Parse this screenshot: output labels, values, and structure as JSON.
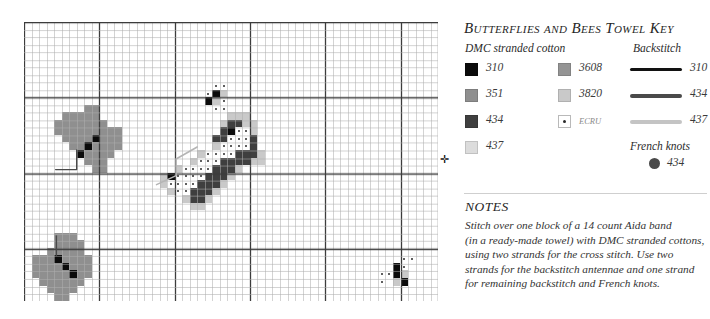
{
  "key": {
    "title": "Butterflies and Bees Towel Key",
    "subhead_dmc": "DMC stranded cotton",
    "subhead_backstitch": "Backstitch",
    "subhead_french_knots": "French knots",
    "floss_left": [
      {
        "code": "310",
        "color": "#0b0b0b",
        "swatch": "solid"
      },
      {
        "code": "351",
        "color": "#8f8f8f",
        "swatch": "solid"
      },
      {
        "code": "434",
        "color": "#3f3f3f",
        "swatch": "solid"
      },
      {
        "code": "437",
        "color": "#dcdcdc",
        "swatch": "solid"
      }
    ],
    "floss_right": [
      {
        "code": "3608",
        "color": "#949494",
        "swatch": "solid"
      },
      {
        "code": "3820",
        "color": "#c9c9c9",
        "swatch": "solid"
      },
      {
        "code": "ECRU",
        "color": "#ffffff",
        "swatch": "dotted"
      }
    ],
    "backstitch": [
      {
        "code": "310",
        "color": "#121212",
        "weight": 3
      },
      {
        "code": "434",
        "color": "#4a4a4a",
        "weight": 4
      },
      {
        "code": "437",
        "color": "#c4c4c4",
        "weight": 4
      }
    ],
    "french_knots": [
      {
        "code": "434",
        "color": "#4a4a4a"
      }
    ]
  },
  "notes": {
    "heading": "NOTES",
    "lines": [
      "Stitch over one block of a 14 count Aida band",
      "(in a ready-made towel) with DMC stranded cottons,",
      "using two strands for the cross stitch. Use two",
      "strands for the backstitch antennae and one strand",
      "for remaining backstitch and French knots."
    ]
  },
  "chart_data": {
    "type": "heatmap",
    "title": "Butterflies and Bees Towel Key",
    "xlabel": "",
    "ylabel": "",
    "grid": true,
    "legend_position": "right",
    "columns": 55,
    "rows": 37,
    "cell_px": 7.53,
    "heavy_line_every": 10,
    "grid_line_color": "#aeaeae",
    "heavy_line_color": "#3c3c3c",
    "center_markers": [
      {
        "edge": "right",
        "row": 18
      },
      {
        "edge": "left",
        "row": 18
      }
    ],
    "palette": {
      "310": "#0b0b0b",
      "351": "#8f8f8f",
      "434": "#3f3f3f",
      "437": "#dcdcdc",
      "3608": "#949494",
      "3820": "#c9c9c9",
      "ECRU": "#ffffff"
    },
    "cells": [
      {
        "c": 5,
        "r": 12,
        "v": "351"
      },
      {
        "c": 6,
        "r": 12,
        "v": "351"
      },
      {
        "c": 7,
        "r": 12,
        "v": "351"
      },
      {
        "c": 8,
        "r": 11,
        "v": "351"
      },
      {
        "c": 9,
        "r": 11,
        "v": "351"
      },
      {
        "c": 8,
        "r": 12,
        "v": "351"
      },
      {
        "c": 9,
        "r": 12,
        "v": "351"
      },
      {
        "c": 4,
        "r": 13,
        "v": "351"
      },
      {
        "c": 5,
        "r": 13,
        "v": "351"
      },
      {
        "c": 6,
        "r": 13,
        "v": "351"
      },
      {
        "c": 7,
        "r": 13,
        "v": "351"
      },
      {
        "c": 8,
        "r": 13,
        "v": "351"
      },
      {
        "c": 9,
        "r": 13,
        "v": "351"
      },
      {
        "c": 10,
        "r": 13,
        "v": "351"
      },
      {
        "c": 4,
        "r": 14,
        "v": "351"
      },
      {
        "c": 5,
        "r": 14,
        "v": "351"
      },
      {
        "c": 6,
        "r": 14,
        "v": "351"
      },
      {
        "c": 7,
        "r": 14,
        "v": "351"
      },
      {
        "c": 8,
        "r": 14,
        "v": "351"
      },
      {
        "c": 9,
        "r": 14,
        "v": "351"
      },
      {
        "c": 10,
        "r": 14,
        "v": "351"
      },
      {
        "c": 11,
        "r": 14,
        "v": "351"
      },
      {
        "c": 12,
        "r": 14,
        "v": "351"
      },
      {
        "c": 5,
        "r": 15,
        "v": "351"
      },
      {
        "c": 6,
        "r": 15,
        "v": "351"
      },
      {
        "c": 7,
        "r": 15,
        "v": "351"
      },
      {
        "c": 8,
        "r": 15,
        "v": "351"
      },
      {
        "c": 9,
        "r": 15,
        "v": "310"
      },
      {
        "c": 10,
        "r": 15,
        "v": "351"
      },
      {
        "c": 11,
        "r": 15,
        "v": "351"
      },
      {
        "c": 12,
        "r": 15,
        "v": "351"
      },
      {
        "c": 6,
        "r": 16,
        "v": "351"
      },
      {
        "c": 7,
        "r": 16,
        "v": "351"
      },
      {
        "c": 8,
        "r": 16,
        "v": "310"
      },
      {
        "c": 9,
        "r": 16,
        "v": "351"
      },
      {
        "c": 10,
        "r": 16,
        "v": "351"
      },
      {
        "c": 11,
        "r": 16,
        "v": "351"
      },
      {
        "c": 12,
        "r": 16,
        "v": "351"
      },
      {
        "c": 7,
        "r": 17,
        "v": "310"
      },
      {
        "c": 8,
        "r": 17,
        "v": "351"
      },
      {
        "c": 9,
        "r": 17,
        "v": "351"
      },
      {
        "c": 10,
        "r": 17,
        "v": "351"
      },
      {
        "c": 11,
        "r": 17,
        "v": "351"
      },
      {
        "c": 8,
        "r": 18,
        "v": "351"
      },
      {
        "c": 9,
        "r": 18,
        "v": "351"
      },
      {
        "c": 10,
        "r": 18,
        "v": "351"
      },
      {
        "c": 9,
        "r": 19,
        "v": "351"
      },
      {
        "c": 10,
        "r": 19,
        "v": "351"
      },
      {
        "c": 4,
        "r": 28,
        "v": "351"
      },
      {
        "c": 5,
        "r": 28,
        "v": "351"
      },
      {
        "c": 6,
        "r": 28,
        "v": "351"
      },
      {
        "c": 4,
        "r": 29,
        "v": "351"
      },
      {
        "c": 5,
        "r": 29,
        "v": "351"
      },
      {
        "c": 6,
        "r": 29,
        "v": "351"
      },
      {
        "c": 7,
        "r": 29,
        "v": "351"
      },
      {
        "c": 3,
        "r": 30,
        "v": "351"
      },
      {
        "c": 4,
        "r": 30,
        "v": "351"
      },
      {
        "c": 5,
        "r": 30,
        "v": "351"
      },
      {
        "c": 6,
        "r": 30,
        "v": "351"
      },
      {
        "c": 7,
        "r": 30,
        "v": "351"
      },
      {
        "c": 1,
        "r": 31,
        "v": "351"
      },
      {
        "c": 2,
        "r": 31,
        "v": "351"
      },
      {
        "c": 3,
        "r": 31,
        "v": "351"
      },
      {
        "c": 4,
        "r": 31,
        "v": "310"
      },
      {
        "c": 5,
        "r": 31,
        "v": "351"
      },
      {
        "c": 6,
        "r": 31,
        "v": "351"
      },
      {
        "c": 7,
        "r": 31,
        "v": "351"
      },
      {
        "c": 8,
        "r": 31,
        "v": "351"
      },
      {
        "c": 1,
        "r": 32,
        "v": "351"
      },
      {
        "c": 2,
        "r": 32,
        "v": "351"
      },
      {
        "c": 3,
        "r": 32,
        "v": "351"
      },
      {
        "c": 4,
        "r": 32,
        "v": "351"
      },
      {
        "c": 5,
        "r": 32,
        "v": "310"
      },
      {
        "c": 6,
        "r": 32,
        "v": "351"
      },
      {
        "c": 7,
        "r": 32,
        "v": "351"
      },
      {
        "c": 8,
        "r": 32,
        "v": "351"
      },
      {
        "c": 1,
        "r": 33,
        "v": "351"
      },
      {
        "c": 2,
        "r": 33,
        "v": "351"
      },
      {
        "c": 3,
        "r": 33,
        "v": "351"
      },
      {
        "c": 4,
        "r": 33,
        "v": "351"
      },
      {
        "c": 5,
        "r": 33,
        "v": "351"
      },
      {
        "c": 6,
        "r": 33,
        "v": "310"
      },
      {
        "c": 7,
        "r": 33,
        "v": "351"
      },
      {
        "c": 8,
        "r": 33,
        "v": "351"
      },
      {
        "c": 2,
        "r": 34,
        "v": "351"
      },
      {
        "c": 3,
        "r": 34,
        "v": "351"
      },
      {
        "c": 4,
        "r": 34,
        "v": "351"
      },
      {
        "c": 5,
        "r": 34,
        "v": "351"
      },
      {
        "c": 6,
        "r": 34,
        "v": "351"
      },
      {
        "c": 7,
        "r": 34,
        "v": "351"
      },
      {
        "c": 3,
        "r": 35,
        "v": "351"
      },
      {
        "c": 4,
        "r": 35,
        "v": "351"
      },
      {
        "c": 5,
        "r": 35,
        "v": "351"
      },
      {
        "c": 6,
        "r": 35,
        "v": "351"
      },
      {
        "c": 4,
        "r": 36,
        "v": "351"
      },
      {
        "c": 5,
        "r": 36,
        "v": "351"
      },
      {
        "c": 25,
        "r": 8,
        "v": "ECRU"
      },
      {
        "c": 26,
        "r": 8,
        "v": "ECRU"
      },
      {
        "c": 24,
        "r": 9,
        "v": "ECRU"
      },
      {
        "c": 25,
        "r": 9,
        "v": "310"
      },
      {
        "c": 26,
        "r": 9,
        "v": "3820"
      },
      {
        "c": 24,
        "r": 10,
        "v": "310"
      },
      {
        "c": 25,
        "r": 10,
        "v": "3820"
      },
      {
        "c": 26,
        "r": 10,
        "v": "ECRU"
      },
      {
        "c": 25,
        "r": 11,
        "v": "ECRU"
      },
      {
        "c": 26,
        "r": 11,
        "v": "ECRU"
      },
      {
        "c": 27,
        "r": 12,
        "v": "3820"
      },
      {
        "c": 28,
        "r": 12,
        "v": "3820"
      },
      {
        "c": 29,
        "r": 12,
        "v": "3820"
      },
      {
        "c": 26,
        "r": 13,
        "v": "3820"
      },
      {
        "c": 27,
        "r": 13,
        "v": "434"
      },
      {
        "c": 28,
        "r": 13,
        "v": "434"
      },
      {
        "c": 29,
        "r": 13,
        "v": "3820"
      },
      {
        "c": 30,
        "r": 13,
        "v": "3820"
      },
      {
        "c": 26,
        "r": 14,
        "v": "434"
      },
      {
        "c": 27,
        "r": 14,
        "v": "310"
      },
      {
        "c": 28,
        "r": 14,
        "v": "ECRU"
      },
      {
        "c": 29,
        "r": 14,
        "v": "ECRU"
      },
      {
        "c": 30,
        "r": 14,
        "v": "3820"
      },
      {
        "c": 25,
        "r": 15,
        "v": "434"
      },
      {
        "c": 26,
        "r": 15,
        "v": "434"
      },
      {
        "c": 27,
        "r": 15,
        "v": "ECRU"
      },
      {
        "c": 28,
        "r": 15,
        "v": "ECRU"
      },
      {
        "c": 29,
        "r": 15,
        "v": "ECRU"
      },
      {
        "c": 30,
        "r": 15,
        "v": "434"
      },
      {
        "c": 25,
        "r": 16,
        "v": "3820"
      },
      {
        "c": 26,
        "r": 16,
        "v": "ECRU"
      },
      {
        "c": 27,
        "r": 16,
        "v": "ECRU"
      },
      {
        "c": 28,
        "r": 16,
        "v": "ECRU"
      },
      {
        "c": 29,
        "r": 16,
        "v": "ECRU"
      },
      {
        "c": 30,
        "r": 16,
        "v": "434"
      },
      {
        "c": 23,
        "r": 17,
        "v": "3820"
      },
      {
        "c": 24,
        "r": 17,
        "v": "ECRU"
      },
      {
        "c": 25,
        "r": 17,
        "v": "ECRU"
      },
      {
        "c": 26,
        "r": 17,
        "v": "ECRU"
      },
      {
        "c": 27,
        "r": 17,
        "v": "ECRU"
      },
      {
        "c": 28,
        "r": 17,
        "v": "434"
      },
      {
        "c": 29,
        "r": 17,
        "v": "434"
      },
      {
        "c": 30,
        "r": 17,
        "v": "434"
      },
      {
        "c": 31,
        "r": 17,
        "v": "3820"
      },
      {
        "c": 22,
        "r": 18,
        "v": "3820"
      },
      {
        "c": 23,
        "r": 18,
        "v": "ECRU"
      },
      {
        "c": 24,
        "r": 18,
        "v": "ECRU"
      },
      {
        "c": 25,
        "r": 18,
        "v": "ECRU"
      },
      {
        "c": 26,
        "r": 18,
        "v": "434"
      },
      {
        "c": 27,
        "r": 18,
        "v": "434"
      },
      {
        "c": 28,
        "r": 18,
        "v": "434"
      },
      {
        "c": 29,
        "r": 18,
        "v": "434"
      },
      {
        "c": 30,
        "r": 18,
        "v": "3820"
      },
      {
        "c": 31,
        "r": 18,
        "v": "3820"
      },
      {
        "c": 20,
        "r": 19,
        "v": "3820"
      },
      {
        "c": 21,
        "r": 19,
        "v": "ECRU"
      },
      {
        "c": 22,
        "r": 19,
        "v": "ECRU"
      },
      {
        "c": 23,
        "r": 19,
        "v": "ECRU"
      },
      {
        "c": 24,
        "r": 19,
        "v": "ECRU"
      },
      {
        "c": 25,
        "r": 19,
        "v": "434"
      },
      {
        "c": 26,
        "r": 19,
        "v": "434"
      },
      {
        "c": 27,
        "r": 19,
        "v": "434"
      },
      {
        "c": 28,
        "r": 19,
        "v": "3820"
      },
      {
        "c": 18,
        "r": 20,
        "v": "3820"
      },
      {
        "c": 19,
        "r": 20,
        "v": "310"
      },
      {
        "c": 20,
        "r": 20,
        "v": "ECRU"
      },
      {
        "c": 21,
        "r": 20,
        "v": "ECRU"
      },
      {
        "c": 22,
        "r": 20,
        "v": "ECRU"
      },
      {
        "c": 23,
        "r": 20,
        "v": "ECRU"
      },
      {
        "c": 24,
        "r": 20,
        "v": "434"
      },
      {
        "c": 25,
        "r": 20,
        "v": "434"
      },
      {
        "c": 26,
        "r": 20,
        "v": "434"
      },
      {
        "c": 27,
        "r": 20,
        "v": "3820"
      },
      {
        "c": 18,
        "r": 21,
        "v": "3820"
      },
      {
        "c": 19,
        "r": 21,
        "v": "ECRU"
      },
      {
        "c": 20,
        "r": 21,
        "v": "ECRU"
      },
      {
        "c": 21,
        "r": 21,
        "v": "ECRU"
      },
      {
        "c": 22,
        "r": 21,
        "v": "ECRU"
      },
      {
        "c": 23,
        "r": 21,
        "v": "434"
      },
      {
        "c": 24,
        "r": 21,
        "v": "434"
      },
      {
        "c": 25,
        "r": 21,
        "v": "434"
      },
      {
        "c": 26,
        "r": 21,
        "v": "3820"
      },
      {
        "c": 19,
        "r": 22,
        "v": "3820"
      },
      {
        "c": 20,
        "r": 22,
        "v": "ECRU"
      },
      {
        "c": 21,
        "r": 22,
        "v": "ECRU"
      },
      {
        "c": 22,
        "r": 22,
        "v": "434"
      },
      {
        "c": 23,
        "r": 22,
        "v": "434"
      },
      {
        "c": 24,
        "r": 22,
        "v": "434"
      },
      {
        "c": 25,
        "r": 22,
        "v": "3820"
      },
      {
        "c": 21,
        "r": 23,
        "v": "3820"
      },
      {
        "c": 22,
        "r": 23,
        "v": "434"
      },
      {
        "c": 23,
        "r": 23,
        "v": "434"
      },
      {
        "c": 24,
        "r": 23,
        "v": "3820"
      },
      {
        "c": 22,
        "r": 24,
        "v": "3820"
      },
      {
        "c": 23,
        "r": 24,
        "v": "3820"
      },
      {
        "c": 50,
        "r": 31,
        "v": "ECRU"
      },
      {
        "c": 51,
        "r": 31,
        "v": "ECRU"
      },
      {
        "c": 49,
        "r": 32,
        "v": "310"
      },
      {
        "c": 50,
        "r": 32,
        "v": "ECRU"
      },
      {
        "c": 47,
        "r": 33,
        "v": "ECRU"
      },
      {
        "c": 48,
        "r": 33,
        "v": "ECRU"
      },
      {
        "c": 49,
        "r": 33,
        "v": "310"
      },
      {
        "c": 50,
        "r": 33,
        "v": "3820"
      },
      {
        "c": 47,
        "r": 34,
        "v": "ECRU"
      },
      {
        "c": 49,
        "r": 34,
        "v": "3820"
      },
      {
        "c": 50,
        "r": 34,
        "v": "310"
      }
    ],
    "backstitch_paths": [
      {
        "color": "#4a4a4a",
        "width": 1.4,
        "points": [
          [
            7.0,
            17.0
          ],
          [
            7.0,
            19.6
          ],
          [
            4.2,
            19.6
          ]
        ]
      },
      {
        "color": "#4a4a4a",
        "width": 1.4,
        "points": [
          [
            4.3,
            31.0
          ],
          [
            4.3,
            28.4
          ]
        ]
      },
      {
        "color": "#b5b5b5",
        "width": 1.6,
        "points": [
          [
            17.6,
            21.6
          ],
          [
            20.2,
            20.4
          ],
          [
            20.2,
            18.2
          ],
          [
            23.0,
            16.6
          ]
        ]
      }
    ]
  }
}
